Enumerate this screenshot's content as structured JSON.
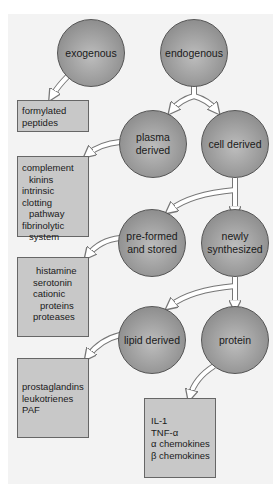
{
  "diagram": {
    "title": "",
    "nodes": {
      "exogenous": "exogenous",
      "endogenous": "endogenous",
      "plasma_derived": [
        "plasma",
        "derived"
      ],
      "cell_derived": "cell derived",
      "preformed": [
        "pre-formed",
        "and stored"
      ],
      "newly_synthesized": [
        "newly",
        "synthesized"
      ],
      "lipid_derived": "lipid derived",
      "protein": "protein"
    },
    "boxes": {
      "exogenous": [
        "formylated",
        "peptides"
      ],
      "plasma": [
        "complement",
        "kinins",
        "intrinsic clotting",
        "pathway",
        "fibrinolytic",
        "system"
      ],
      "preformed": [
        "histamine",
        "serotonin",
        "cationic",
        "proteins",
        "proteases"
      ],
      "lipid": [
        "prostaglandins",
        "leukotrienes",
        "PAF"
      ],
      "protein": [
        "IL-1",
        "TNF-α",
        "α chemokines",
        "β chemokines"
      ]
    },
    "edges": [
      [
        "exogenous",
        "formylated peptides"
      ],
      [
        "endogenous",
        "plasma derived"
      ],
      [
        "endogenous",
        "cell derived"
      ],
      [
        "plasma derived",
        "complement box"
      ],
      [
        "cell derived",
        "pre-formed and stored"
      ],
      [
        "cell derived",
        "newly synthesized"
      ],
      [
        "pre-formed and stored",
        "histamine box"
      ],
      [
        "newly synthesized",
        "lipid derived"
      ],
      [
        "newly synthesized",
        "protein"
      ],
      [
        "lipid derived",
        "prostaglandins box"
      ],
      [
        "protein",
        "IL-1 box"
      ]
    ],
    "colors": {
      "background": "#f3f3f3",
      "circle": "#9a9a9a",
      "box": "#c8c8c8",
      "arrow": "#ffffff"
    }
  }
}
